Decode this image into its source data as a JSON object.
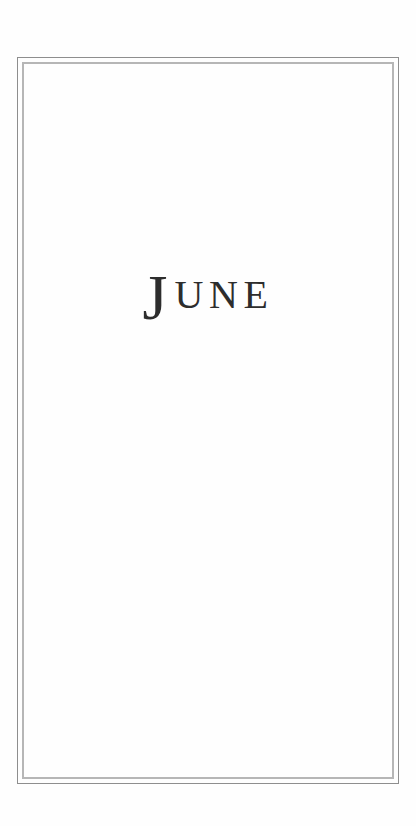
{
  "page": {
    "title": {
      "initial": "J",
      "rest": "UNE"
    }
  },
  "colors": {
    "background": "#fefefe",
    "frame_outer": "#8e8e8e",
    "frame_inner": "#b6b6b6",
    "title_text": "#2d2d2d"
  }
}
